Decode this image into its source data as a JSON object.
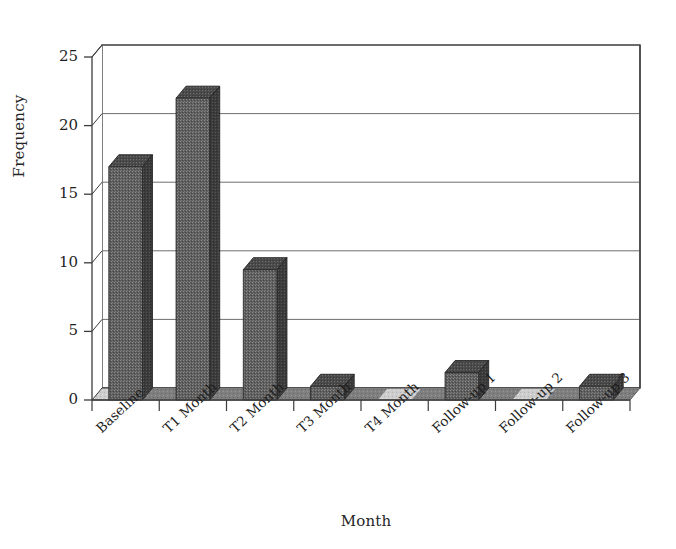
{
  "chart_data": {
    "type": "bar",
    "title": "",
    "subtitle": "",
    "xlabel": "Month",
    "ylabel": "Frequency",
    "categories": [
      "Baseline",
      "T1 Month",
      "T2 Month",
      "T3 Month",
      "T4 Month",
      "Follow-up 1",
      "Follow-up 2",
      "Follow-up 3"
    ],
    "values": [
      17,
      22,
      9.5,
      1,
      0,
      2,
      0,
      1
    ],
    "ylim": [
      0,
      25
    ],
    "yticks": [
      0,
      5,
      10,
      15,
      20,
      25
    ],
    "ytick_labels": [
      "0",
      "5",
      "10",
      "15",
      "20",
      "25"
    ],
    "grid": true,
    "grid_axis": "y",
    "legend": false,
    "legend_position": "none",
    "style": "3d-column",
    "series": [
      {
        "name": "Frequency",
        "values": [
          17,
          22,
          9.5,
          1,
          0,
          2,
          0,
          1
        ]
      }
    ]
  },
  "colors": {
    "bar_front": "#5d5d5d",
    "bar_top": "#4a4a4a",
    "bar_side": "#3a3a3a",
    "floor_light": "#c9c9c9",
    "floor_dark": "#7d7d7d",
    "axis": "#3b3b3b",
    "grid": "#6e6e6e",
    "text": "#1f1f1f",
    "background": "#ffffff"
  }
}
